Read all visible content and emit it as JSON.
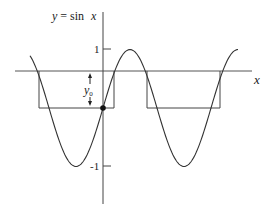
{
  "figure": {
    "title": "y = sin x",
    "title_parts": {
      "y": "y",
      "eq": " = sin ",
      "x": "x"
    },
    "x_axis_label": "x",
    "y_ticks": [
      {
        "label": "1",
        "value": 1
      },
      {
        "label": "-1",
        "value": -1
      }
    ],
    "annotation": {
      "symbol": "y",
      "subscript": "0"
    },
    "colors": {
      "ink": "#222222",
      "background": "#ffffff"
    }
  },
  "diagram": {
    "curve": "sine wave y = sin x",
    "horizontal_line": "line at level y0 above the curve's zero level, labeled x",
    "rectangles": 2,
    "marked_point": "intersection of curve with vertical axis"
  }
}
